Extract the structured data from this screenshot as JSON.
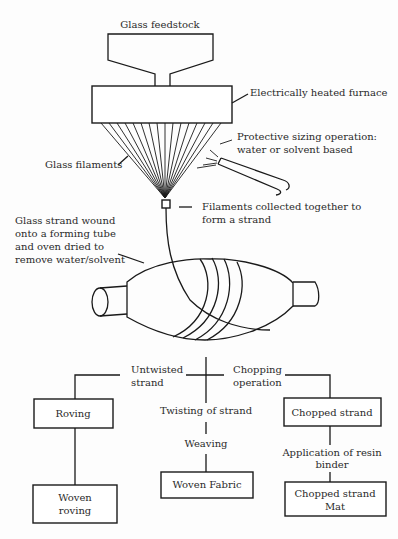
{
  "diagram": {
    "labels": {
      "feedstock": "Glass feedstock",
      "furnace": "Electrically heated furnace",
      "sizing_line1": "Protective sizing operation:",
      "sizing_line2": "water or solvent based",
      "filaments": "Glass filaments",
      "collected_line1": "Filaments collected together to",
      "collected_line2": "form a strand",
      "wound_line1": "Glass strand wound",
      "wound_line2": "onto a forming tube",
      "wound_line3": "and oven dried to",
      "wound_line4": "remove water/solvent",
      "untwisted_line1": "Untwisted",
      "untwisted_line2": "strand",
      "chopping_line1": "Chopping",
      "chopping_line2": "operation",
      "twisting": "Twisting of strand",
      "weaving": "Weaving",
      "resin_line1": "Application of resin",
      "resin_line2": "binder"
    },
    "boxes": {
      "roving": "Roving",
      "woven_roving_line1": "Woven",
      "woven_roving_line2": "roving",
      "woven_fabric": "Woven Fabric",
      "chopped_strand": "Chopped strand",
      "csm_line1": "Chopped strand",
      "csm_line2": "Mat"
    },
    "colors": {
      "stroke": "#1a1a1a",
      "text": "#2a2a2a",
      "background": "#fdfdfd"
    }
  }
}
